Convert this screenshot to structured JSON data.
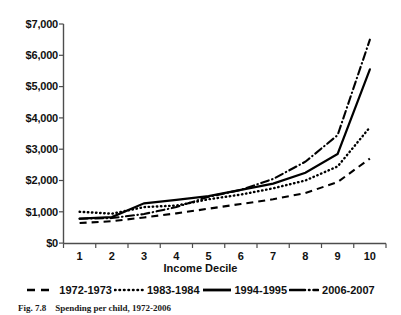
{
  "figure": {
    "caption_number": "Fig. 7.8",
    "caption_text": "Spending per child, 1972-2006"
  },
  "chart_data": {
    "type": "line",
    "title": "",
    "xlabel": "Income Decile",
    "ylabel": "",
    "categories": [
      "1",
      "2",
      "3",
      "4",
      "5",
      "6",
      "7",
      "8",
      "9",
      "10"
    ],
    "x": [
      1,
      2,
      3,
      4,
      5,
      6,
      7,
      8,
      9,
      10
    ],
    "ylim": [
      0,
      7000
    ],
    "ytick_values": [
      0,
      1000,
      2000,
      3000,
      4000,
      5000,
      6000,
      7000
    ],
    "ytick_labels": [
      "$0",
      "$1,000",
      "$2,000",
      "$3,000",
      "$4,000",
      "$5,000",
      "$6,000",
      "$7,000"
    ],
    "grid": false,
    "legend_position": "below-axis",
    "series": [
      {
        "name": "1972-1973",
        "style": "dashed",
        "color": "#000000",
        "values": [
          640,
          700,
          820,
          950,
          1100,
          1250,
          1400,
          1600,
          1950,
          2700
        ]
      },
      {
        "name": "1983-1984",
        "style": "dotted",
        "color": "#000000",
        "values": [
          1000,
          940,
          1150,
          1200,
          1400,
          1550,
          1750,
          2000,
          2450,
          3700
        ]
      },
      {
        "name": "1994-1995",
        "style": "solid",
        "color": "#000000",
        "values": [
          780,
          830,
          1270,
          1380,
          1500,
          1700,
          1900,
          2250,
          2850,
          5550
        ]
      },
      {
        "name": "2006-2007",
        "style": "dash-dot",
        "color": "#000000",
        "values": [
          780,
          800,
          930,
          1150,
          1480,
          1700,
          2050,
          2600,
          3450,
          6500
        ]
      }
    ]
  }
}
